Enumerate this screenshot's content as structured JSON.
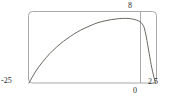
{
  "chart_data": {
    "type": "line",
    "title": "",
    "xlabel": "",
    "ylabel": "",
    "xlim": [
      -25,
      2.5
    ],
    "ylim": [
      0,
      8
    ],
    "grid": false,
    "legend": false,
    "tick_labels": {
      "y_max": "8",
      "x_min": "-25",
      "x_zero": "0",
      "x_max": "2.5"
    },
    "series": [
      {
        "name": "curve",
        "color": "#6b6660",
        "x": [
          -25,
          -23.5,
          -22,
          -20.5,
          -19,
          -17.5,
          -16,
          -14.5,
          -13,
          -11.5,
          -10,
          -8.5,
          -7,
          -5.5,
          -4,
          -3,
          -2,
          -1.2,
          -0.6,
          -0.2,
          0,
          0.25,
          0.5,
          0.8,
          1.1,
          1.4,
          1.7,
          2.0,
          2.3,
          2.5
        ],
        "y": [
          0,
          1.35,
          2.4,
          3.3,
          4.05,
          4.7,
          5.25,
          5.75,
          6.15,
          6.5,
          6.8,
          7.0,
          7.15,
          7.25,
          7.28,
          7.25,
          7.15,
          7.0,
          6.8,
          6.5,
          6.3,
          5.8,
          5.2,
          4.3,
          3.4,
          2.5,
          1.7,
          1.0,
          0.35,
          0
        ]
      }
    ],
    "annotations": []
  },
  "frame": {
    "border_color": "#a9a9a9",
    "axis_line_color": "#a9a9a9"
  },
  "colors": {
    "curve": "#6b6660",
    "frame": "#a9a9a9",
    "text": "#2b2b2b",
    "background": "#ffffff"
  }
}
